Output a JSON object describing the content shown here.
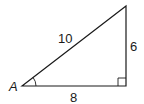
{
  "figure": {
    "type": "right-triangle",
    "vertex_label": "A",
    "hypotenuse_label": "10",
    "vertical_leg_label": "6",
    "horizontal_leg_label": "8",
    "stroke_color": "#1a1a1a",
    "background": "#ffffff"
  }
}
